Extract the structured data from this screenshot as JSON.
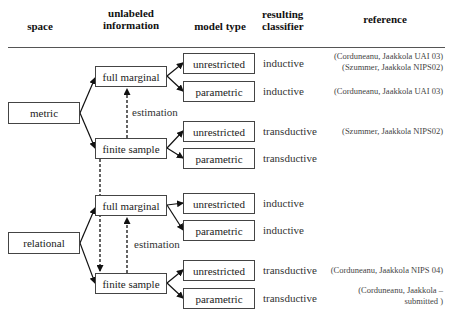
{
  "headers": {
    "space": "space",
    "unlabeled_1": "unlabeled",
    "unlabeled_2": "information",
    "model_type": "model type",
    "resulting_1": "resulting",
    "resulting_2": "classifier",
    "reference": "reference"
  },
  "spaces": [
    {
      "label": "metric",
      "full_marginal": "full marginal",
      "finite_sample": "finite sample",
      "estimation": "estimation",
      "rows": [
        {
          "model": "unrestricted",
          "classifier": "inductive",
          "ref": [
            "(Corduneanu, Jaakkola UAI 03)",
            "(Szummer, Jaakkola NIPS02)"
          ]
        },
        {
          "model": "parametric",
          "classifier": "inductive",
          "ref": [
            "(Corduneanu, Jaakkola UAI 03)"
          ]
        },
        {
          "model": "unrestricted",
          "classifier": "transductive",
          "ref": [
            "(Szummer, Jaakkola NIPS02)"
          ]
        },
        {
          "model": "parametric",
          "classifier": "transductive",
          "ref": []
        }
      ]
    },
    {
      "label": "relational",
      "full_marginal": "full marginal",
      "finite_sample": "finite sample",
      "estimation": "estimation",
      "rows": [
        {
          "model": "unrestricted",
          "classifier": "inductive",
          "ref": []
        },
        {
          "model": "parametric",
          "classifier": "inductive",
          "ref": []
        },
        {
          "model": "unrestricted",
          "classifier": "transductive",
          "ref": [
            "(Corduneanu, Jaakkola NIPS 04)"
          ]
        },
        {
          "model": "parametric",
          "classifier": "transductive",
          "ref": [
            "(Corduneanu, Jaakkola –",
            "submitted )"
          ]
        }
      ]
    }
  ]
}
